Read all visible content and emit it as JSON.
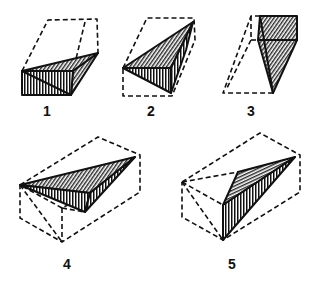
{
  "figure": {
    "colors": {
      "line": "#111111",
      "background": "#ffffff"
    },
    "panels": [
      {
        "id": 1,
        "label": "1",
        "label_pos": [
          47,
          104
        ]
      },
      {
        "id": 2,
        "label": "2",
        "label_pos": [
          151,
          104
        ]
      },
      {
        "id": 3,
        "label": "3",
        "label_pos": [
          251,
          104
        ]
      },
      {
        "id": 4,
        "label": "4",
        "label_pos": [
          67,
          257
        ]
      },
      {
        "id": 5,
        "label": "5",
        "label_pos": [
          232,
          257
        ]
      }
    ]
  }
}
